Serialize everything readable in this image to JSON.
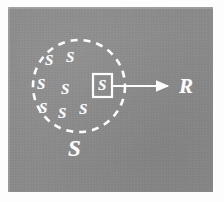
{
  "figure": {
    "kind": "physics-diagram",
    "caption_symbols": {
      "system_symbol": "S",
      "radius_symbol": "R"
    },
    "colors": {
      "background": "#ffffff",
      "panel_gray": "#8b8b8b",
      "ink_white": "#fdfdfd"
    },
    "panel": {
      "x": 8,
      "y": 7,
      "width": 205,
      "height": 185
    },
    "boundary_circle": {
      "name": "dashed-boundary-circle",
      "center_x": 79,
      "center_y": 86,
      "radius": 46,
      "stroke": "#fdfdfd",
      "stroke_width": 2.6,
      "dash": "7 6"
    },
    "inner_symbols": [
      {
        "text": "S",
        "x": 45,
        "y": 53
      },
      {
        "text": "S",
        "x": 66,
        "y": 50
      },
      {
        "text": "S",
        "x": 37,
        "y": 77
      },
      {
        "text": "S",
        "x": 61,
        "y": 82
      },
      {
        "text": "S",
        "x": 39,
        "y": 101
      },
      {
        "text": "S",
        "x": 58,
        "y": 106
      },
      {
        "text": "S",
        "x": 79,
        "y": 102
      }
    ],
    "boxed_symbol": {
      "name": "highlighted-subsystem",
      "text": "S",
      "box_x": 93,
      "box_y": 74,
      "box_width": 19,
      "box_height": 23,
      "text_x": 98,
      "text_y": 78
    },
    "radius_arrow": {
      "name": "radius-arrow",
      "x1": 112,
      "y1": 86,
      "x2": 170,
      "y2": 86,
      "stroke_width": 2.2
    },
    "radius_label": {
      "text": "R",
      "x": 179,
      "y": 76
    },
    "outer_label": {
      "text": "S",
      "x": 68,
      "y": 137
    }
  }
}
